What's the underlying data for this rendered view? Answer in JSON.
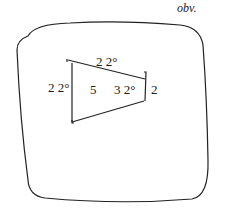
{
  "header": {
    "side_label": "obv."
  },
  "diagram": {
    "type": "tablet-trapezoid",
    "labels": {
      "top_edge": "2 2°",
      "left_edge": "2 2°",
      "center_area": "5",
      "center_right": "3 2°",
      "right_edge": "2"
    },
    "colors": {
      "stroke": "#222222",
      "background": "#ffffff"
    }
  }
}
